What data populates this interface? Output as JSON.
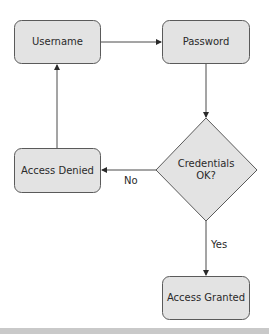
{
  "diagram": {
    "type": "flowchart",
    "colors": {
      "node_fill": "#e3e3e3",
      "node_stroke": "#5a5a5a",
      "edge_stroke": "#4a4a4a",
      "text": "#2a2a2a",
      "bottom_bar": "#c9c9c9"
    },
    "nodes": [
      {
        "id": "username",
        "shape": "rounded-rect",
        "label": "Username"
      },
      {
        "id": "password",
        "shape": "rounded-rect",
        "label": "Password"
      },
      {
        "id": "credentials_check",
        "shape": "diamond",
        "label_line1": "Credentials",
        "label_line2": "OK?"
      },
      {
        "id": "access_denied",
        "shape": "rounded-rect",
        "label": "Access Denied"
      },
      {
        "id": "access_granted",
        "shape": "rounded-rect",
        "label": "Access Granted"
      }
    ],
    "edges": [
      {
        "from": "username",
        "to": "password",
        "label": ""
      },
      {
        "from": "password",
        "to": "credentials_check",
        "label": ""
      },
      {
        "from": "credentials_check",
        "to": "access_denied",
        "label": "No"
      },
      {
        "from": "credentials_check",
        "to": "access_granted",
        "label": "Yes"
      },
      {
        "from": "access_denied",
        "to": "username",
        "label": ""
      }
    ]
  }
}
